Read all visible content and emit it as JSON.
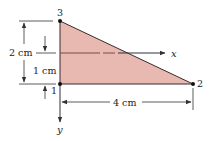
{
  "diagram": {
    "type": "triangular-element",
    "colors": {
      "fill": "#e8b9b0",
      "edge": "#3a2a2a",
      "axis": "#333333",
      "node": "#111111",
      "dashed_axis": "#7a4a44"
    },
    "nodes": [
      {
        "id": "1",
        "label": "1"
      },
      {
        "id": "2",
        "label": "2"
      },
      {
        "id": "3",
        "label": "3"
      }
    ],
    "axes": {
      "x_label": "x",
      "y_label": "y"
    },
    "dimensions": {
      "height_total": "2 cm",
      "height_axis": "1 cm",
      "base_width": "4 cm"
    }
  }
}
